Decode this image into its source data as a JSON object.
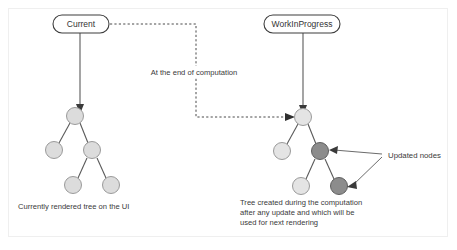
{
  "diagram": {
    "title_nodes": {
      "current": "Current",
      "work_in_progress": "WorkInProgress"
    },
    "path_label": "At the end of computation",
    "annotation": "Updated nodes",
    "captions": {
      "left": "Currently rendered tree on the UI",
      "right_line1": "Tree  created during the computation",
      "right_line2": "after any update and which will be",
      "right_line3": "used for next rendering"
    },
    "colors": {
      "node_light": "#dcdcdc",
      "node_light_stroke": "#9a9a9a",
      "node_updated": "#8c8c8c",
      "node_updated_stroke": "#5f5f5f",
      "edge": "#5a5a5a",
      "dashed": "#4a4a4a",
      "pill_stroke": "#3d3d3d",
      "frame": "#efefef",
      "text": "#3a3a3a"
    },
    "left_tree": {
      "label": "current-tree",
      "nodes": [
        {
          "id": "l-root",
          "cx": 75,
          "cy": 116,
          "r": 8.5,
          "state": "normal"
        },
        {
          "id": "l-child-left",
          "cx": 54,
          "cy": 150,
          "r": 8.5,
          "state": "normal"
        },
        {
          "id": "l-child-right",
          "cx": 92,
          "cy": 150,
          "r": 8.5,
          "state": "normal"
        },
        {
          "id": "l-grand-left",
          "cx": 73,
          "cy": 185,
          "r": 8.5,
          "state": "normal"
        },
        {
          "id": "l-grand-right",
          "cx": 111,
          "cy": 185,
          "r": 8.5,
          "state": "normal"
        }
      ]
    },
    "right_tree": {
      "label": "workinprogress-tree",
      "nodes": [
        {
          "id": "r-root",
          "cx": 303,
          "cy": 117,
          "r": 8.5,
          "state": "normal"
        },
        {
          "id": "r-child-left",
          "cx": 282,
          "cy": 151,
          "r": 8.5,
          "state": "normal"
        },
        {
          "id": "r-child-right",
          "cx": 320,
          "cy": 151,
          "r": 8.5,
          "state": "updated"
        },
        {
          "id": "r-grand-left",
          "cx": 301,
          "cy": 186,
          "r": 8.5,
          "state": "normal"
        },
        {
          "id": "r-grand-right",
          "cx": 339,
          "cy": 186,
          "r": 8.5,
          "state": "updated"
        }
      ]
    }
  }
}
